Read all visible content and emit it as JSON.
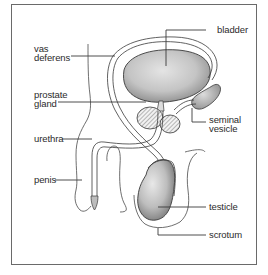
{
  "diagram": {
    "type": "anatomical illustration",
    "labels": {
      "bladder": "bladder",
      "vas_deferens_1": "vas",
      "vas_deferens_2": "deferens",
      "prostate_1": "prostate",
      "prostate_2": "gland",
      "seminal_1": "seminal",
      "seminal_2": "vesicle",
      "urethra": "urethra",
      "penis": "penis",
      "testicle": "testicle",
      "scrotum": "scrotum"
    },
    "colors": {
      "frame": "#6a6a6a",
      "line": "#3a3a3a",
      "organ_shade": "#b9b9b9",
      "hatch": "#6b6b6b",
      "text": "#2b2b2b"
    }
  }
}
